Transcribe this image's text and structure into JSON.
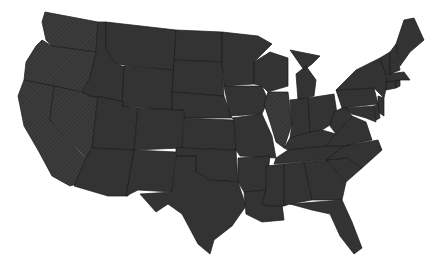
{
  "map": {
    "title": "",
    "type": "choropleth-us-states",
    "background": "#ffffff",
    "colors": {
      "fill": "#333333",
      "hatched": "#3a3a3a",
      "border": "#1a1a1a"
    },
    "hatched_states": [
      "Washington",
      "Oregon",
      "California",
      "Nevada",
      "Illinois"
    ],
    "states": [
      {
        "name": "Washington",
        "path": "M45,12 L98,22 L96,52 L52,46 L46,40 L42,22 Z"
      },
      {
        "name": "Oregon",
        "path": "M42,40 L52,46 L96,52 L90,78 L82,92 L24,80 L26,62 L36,46 Z"
      },
      {
        "name": "California",
        "path": "M24,80 L54,86 L50,120 L96,170 L96,178 L70,186 L52,176 L38,150 L24,126 L18,96 Z"
      },
      {
        "name": "Nevada",
        "path": "M54,86 L98,96 L92,148 L86,158 L50,120 Z"
      },
      {
        "name": "Idaho",
        "path": "M98,22 L106,22 L106,48 L116,64 L128,68 L124,102 L90,96 L82,92 L90,78 L96,52 Z"
      },
      {
        "name": "Montana",
        "path": "M106,22 L176,30 L174,70 L130,66 L116,64 L106,48 Z"
      },
      {
        "name": "Wyoming",
        "path": "M124,66 L174,70 L172,110 L122,106 Z"
      },
      {
        "name": "Utah",
        "path": "M98,96 L124,102 L122,106 L138,108 L134,150 L92,148 Z"
      },
      {
        "name": "Arizona",
        "path": "M92,148 L134,150 L128,196 L108,196 L74,186 L86,158 Z"
      },
      {
        "name": "Colorado",
        "path": "M138,108 L184,110 L182,148 L134,150 Z"
      },
      {
        "name": "New Mexico",
        "path": "M134,150 L176,152 L172,192 L138,190 L126,196 Z"
      },
      {
        "name": "North Dakota",
        "path": "M176,30 L222,32 L222,62 L174,60 Z"
      },
      {
        "name": "South Dakota",
        "path": "M174,60 L222,62 L224,96 L172,92 Z"
      },
      {
        "name": "Nebraska",
        "path": "M172,92 L224,96 L232,118 L184,118 L184,110 L172,110 Z"
      },
      {
        "name": "Kansas",
        "path": "M184,118 L234,120 L236,150 L182,148 Z"
      },
      {
        "name": "Oklahoma",
        "path": "M176,148 L236,150 L238,182 L210,180 L196,172 L196,156 L176,156 Z"
      },
      {
        "name": "Texas",
        "path": "M176,156 L196,156 L196,172 L210,180 L238,182 L246,206 L232,226 L214,240 L210,254 L198,244 L182,214 L168,204 L156,212 L140,194 L172,192 Z"
      },
      {
        "name": "Minnesota",
        "path": "M222,32 L258,36 L272,44 L254,62 L254,84 L224,86 L222,62 Z"
      },
      {
        "name": "Iowa",
        "path": "M224,86 L262,86 L268,100 L262,114 L230,116 Z"
      },
      {
        "name": "Missouri",
        "path": "M232,118 L262,114 L272,136 L276,158 L240,156 L236,150 L234,120 Z"
      },
      {
        "name": "Arkansas",
        "path": "M238,158 L270,156 L266,190 L244,192 L238,182 Z"
      },
      {
        "name": "Louisiana",
        "path": "M244,192 L266,190 L262,204 L282,204 L284,220 L262,222 L246,214 Z"
      },
      {
        "name": "Wisconsin",
        "path": "M254,62 L270,52 L288,58 L288,86 L268,92 L262,86 L254,84 Z"
      },
      {
        "name": "Illinois",
        "path": "M268,92 L288,92 L292,124 L284,148 L276,142 L270,122 L264,104 Z"
      },
      {
        "name": "Michigan",
        "path": "M290,50 L320,56 L312,64 L304,70 Z M296,74 L306,66 L316,80 L314,96 L298,100 Z"
      },
      {
        "name": "Indiana",
        "path": "M290,100 L308,98 L310,132 L290,138 L292,124 Z"
      },
      {
        "name": "Ohio",
        "path": "M308,98 L334,94 L338,120 L322,130 L310,132 Z"
      },
      {
        "name": "Kentucky",
        "path": "M284,148 L290,138 L310,132 L322,130 L336,134 L326,146 L288,150 Z"
      },
      {
        "name": "Tennessee",
        "path": "M276,158 L288,150 L326,146 L350,144 L344,158 L274,164 Z"
      },
      {
        "name": "Mississippi",
        "path": "M266,166 L284,164 L284,206 L268,206 L262,204 L266,190 Z"
      },
      {
        "name": "Alabama",
        "path": "M284,164 L304,162 L312,200 L290,204 L284,206 Z"
      },
      {
        "name": "Georgia",
        "path": "M304,162 L326,160 L346,182 L342,200 L312,200 Z"
      },
      {
        "name": "Florida",
        "path": "M290,204 L342,200 L352,222 L362,248 L354,254 L340,236 L330,214 L312,210 Z"
      },
      {
        "name": "South Carolina",
        "path": "M326,160 L348,158 L362,168 L346,182 Z"
      },
      {
        "name": "North Carolina",
        "path": "M344,146 L378,140 L382,150 L362,168 L348,158 L326,160 Z"
      },
      {
        "name": "Virginia",
        "path": "M336,134 L352,116 L366,122 L372,140 L344,146 L326,146 Z"
      },
      {
        "name": "West Virginia",
        "path": "M334,112 L346,106 L352,116 L336,134 L330,126 Z"
      },
      {
        "name": "Pennsylvania",
        "path": "M336,90 L374,88 L378,104 L342,108 Z"
      },
      {
        "name": "New York",
        "path": "M340,86 L356,70 L380,58 L388,80 L384,98 L374,88 L336,90 Z"
      },
      {
        "name": "New Jersey",
        "path": "M378,96 L384,98 L384,116 L378,112 Z"
      },
      {
        "name": "Maryland",
        "path": "M346,108 L374,106 L376,122 L366,118 L352,114 Z"
      },
      {
        "name": "Delaware",
        "path": "M374,106 L378,104 L380,118 L376,120 Z"
      },
      {
        "name": "Connecticut",
        "path": "M386,82 L396,80 L396,88 L386,90 Z"
      },
      {
        "name": "Rhode Island",
        "path": "M396,80 L400,80 L400,86 L396,88 Z"
      },
      {
        "name": "Massachusetts",
        "path": "M388,74 L404,72 L410,80 L400,80 L386,82 Z"
      },
      {
        "name": "Vermont",
        "path": "M380,58 L390,52 L390,74 L386,76 Z"
      },
      {
        "name": "New Hampshire",
        "path": "M390,52 L396,44 L400,70 L390,74 Z"
      },
      {
        "name": "Maine",
        "path": "M396,44 L404,20 L414,18 L424,40 L410,52 L400,66 Z"
      }
    ]
  }
}
